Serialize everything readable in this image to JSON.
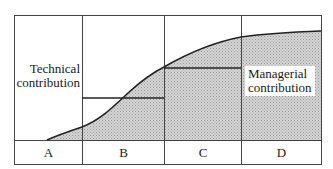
{
  "diagram": {
    "type": "stacked-contribution-curve",
    "labels": {
      "technical": [
        "Technical",
        "contribution"
      ],
      "managerial": [
        "Managerial",
        "contribution"
      ]
    },
    "segments": [
      {
        "id": "A",
        "label": "A"
      },
      {
        "id": "B",
        "label": "B"
      },
      {
        "id": "C",
        "label": "C"
      },
      {
        "id": "D",
        "label": "D"
      }
    ],
    "colors": {
      "line": "#222222",
      "frame": "#444444",
      "shade_base": "#d6d6d6",
      "shade_dot": "#9a9a9a",
      "background": "#ffffff"
    }
  }
}
